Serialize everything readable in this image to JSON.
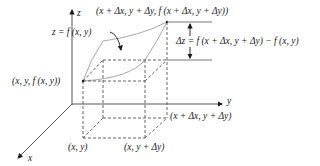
{
  "axes": {
    "z_label": "z",
    "y_label": "y",
    "x_label": "x"
  },
  "labels": {
    "surface": "z = f (x, y)",
    "top_point": "(x + Δx, y + Δy, f (x + Δx, y + Δy))",
    "delta_z": "Δz = f (x + Δx, y + Δy) − f (x, y)",
    "surface_point": "(x, y, f (x, y))",
    "base_xy": "(x, y)",
    "base_x_ydy": "(x, y + Δy)",
    "base_xdx_ydy": "(x + Δx, y + Δy)"
  },
  "colors": {
    "ink": "#1a1a1a",
    "surface_curve": "#a8a8a8",
    "dashed": "#555555",
    "background": "#ffffff"
  }
}
